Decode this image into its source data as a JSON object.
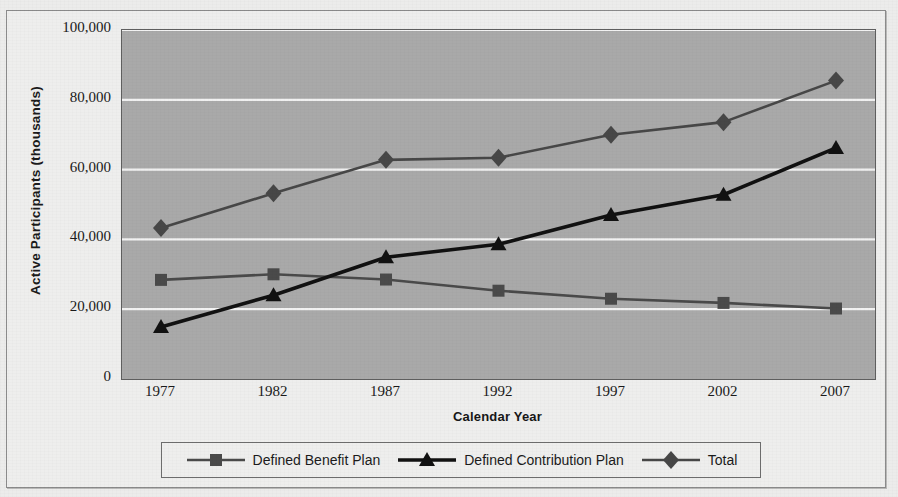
{
  "chart_data": {
    "type": "line",
    "title": "",
    "xlabel": "Calendar Year",
    "ylabel": "Active Participants (thousands)",
    "categories": [
      "1977",
      "1982",
      "1987",
      "1992",
      "1997",
      "2002",
      "2007"
    ],
    "x": [
      1977,
      1982,
      1987,
      1992,
      1997,
      2002,
      2007
    ],
    "ylim": [
      0,
      100000
    ],
    "yticks": [
      "0",
      "20,000",
      "40,000",
      "60,000",
      "80,000",
      "100,000"
    ],
    "ytick_values": [
      0,
      20000,
      40000,
      60000,
      80000,
      100000
    ],
    "grid": true,
    "grid_axis": "y",
    "legend_position": "bottom",
    "plot_background": "#a9a9a9",
    "series": [
      {
        "name": "Defined Benefit Plan",
        "marker": "square",
        "color": "#4a4a4a",
        "values": [
          28400,
          30000,
          28500,
          25300,
          23000,
          21800,
          20200
        ]
      },
      {
        "name": "Defined Contribution Plan",
        "marker": "triangle",
        "color": "#111111",
        "values": [
          14900,
          24000,
          34900,
          38600,
          47000,
          52800,
          66200
        ]
      },
      {
        "name": "Total",
        "marker": "diamond",
        "color": "#474747",
        "values": [
          43300,
          53200,
          62800,
          63400,
          70000,
          73600,
          85500
        ]
      }
    ]
  },
  "axes": {
    "y_title": "Active Participants (thousands)",
    "x_title": "Calendar Year"
  },
  "legend": {
    "items": [
      {
        "label": "Defined Benefit Plan",
        "marker": "square"
      },
      {
        "label": "Defined Contribution Plan",
        "marker": "triangle"
      },
      {
        "label": "Total",
        "marker": "diamond"
      }
    ]
  }
}
